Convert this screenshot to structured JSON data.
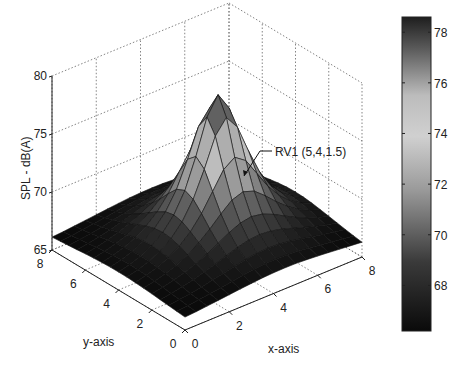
{
  "chart_data": {
    "type": "surface",
    "title": "",
    "xlabel": "x-axis",
    "ylabel": "y-axis",
    "zlabel": "SPL - dB(A)",
    "x_ticks": [
      "0",
      "2",
      "4",
      "6",
      "8"
    ],
    "y_ticks": [
      "0",
      "2",
      "4",
      "6",
      "8"
    ],
    "z_ticks": [
      "65",
      "70",
      "75",
      "80"
    ],
    "xlim": [
      0,
      8
    ],
    "ylim": [
      0,
      8
    ],
    "zlim": [
      65,
      80
    ],
    "grid": true,
    "colormap": "gray",
    "surface": {
      "grid_resolution": 0.5,
      "peak_x": 4.5,
      "peak_y": 4,
      "peak_value": 78.3,
      "floor_value": 65.5,
      "edge_min_value": 65.8
    },
    "annotation": {
      "text": "RV1 (5,4,1.5)"
    },
    "colorbar": {
      "ticks": [
        "68",
        "70",
        "72",
        "74",
        "76",
        "78"
      ],
      "range": [
        66.2,
        78.6
      ]
    }
  }
}
